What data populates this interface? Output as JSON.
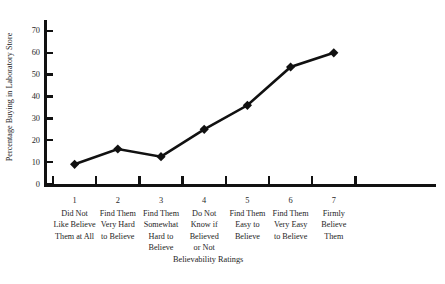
{
  "chart_data": {
    "type": "line",
    "title": "",
    "subtitle": "",
    "xlabel": "Believability Ratings",
    "ylabel": "Percentage Buying in Laboratory Store",
    "x": [
      1,
      2,
      3,
      4,
      5,
      6,
      7
    ],
    "categories": [
      "Did Not Like Believe Them at All",
      "Find Them Very Hard to Believe",
      "Find Them Somewhat Hard to Believe",
      "Do Not Know if Believed or Not",
      "Find Them Easy to Believe",
      "Find Them Very Easy to Believe",
      "Firmly Believe Them"
    ],
    "category_lines": [
      [
        "Did Not",
        "Like Believe",
        "Them at All"
      ],
      [
        "Find Them",
        "Very Hard",
        "to Believe"
      ],
      [
        "Find Them",
        "Somewhat",
        "Hard to",
        "Believe"
      ],
      [
        "Do Not",
        "Know if",
        "Believed",
        "or Not"
      ],
      [
        "Find Them",
        "Easy to",
        "Believe"
      ],
      [
        "Find Them",
        "Very Easy",
        "to Believe"
      ],
      [
        "Firmly",
        "Believe",
        "Them"
      ]
    ],
    "values": [
      9,
      16,
      12.5,
      25,
      36,
      53.5,
      60
    ],
    "xtick_labels": [
      "1",
      "2",
      "3",
      "4",
      "5",
      "6",
      "7"
    ],
    "ytick_labels": [
      "0",
      "10",
      "20",
      "30",
      "40",
      "50",
      "60",
      "70"
    ],
    "ytick_values": [
      0,
      10,
      20,
      30,
      40,
      50,
      60,
      70
    ],
    "ylim": [
      0,
      75
    ],
    "grid": false,
    "legend": false,
    "legend_position": "none",
    "marker": "diamond",
    "series_color": "#111111",
    "background_color": "#ffffff"
  }
}
